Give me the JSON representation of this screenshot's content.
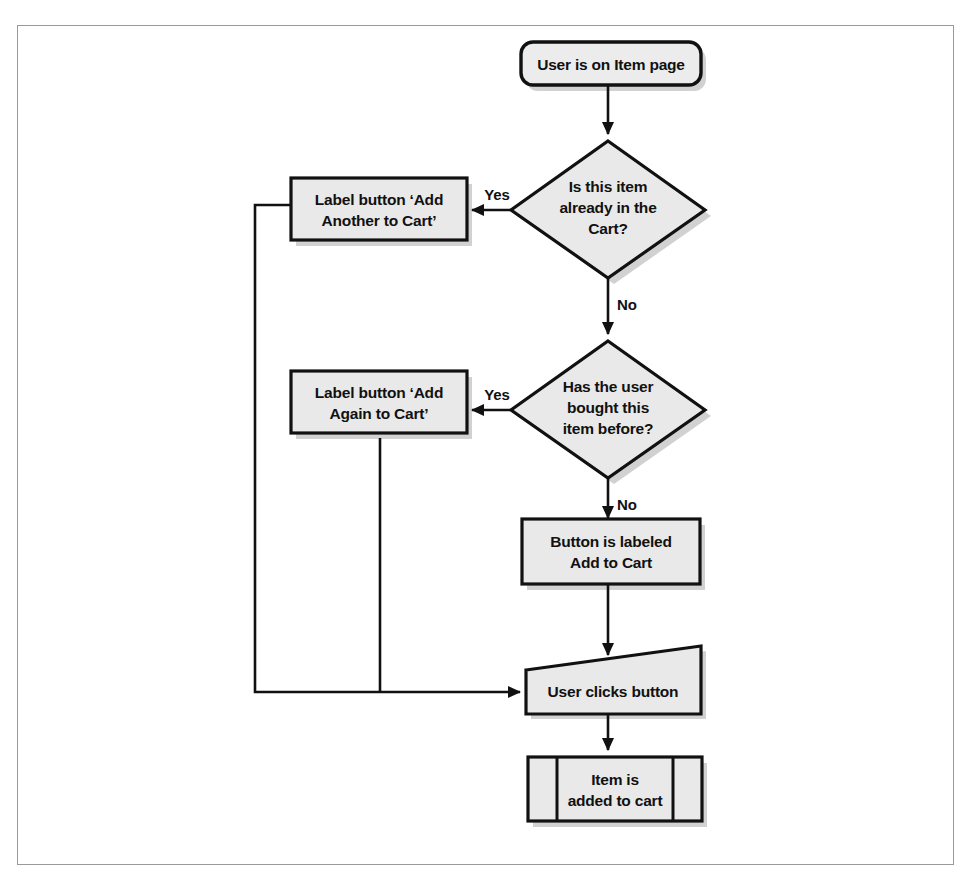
{
  "figure": {
    "type": "flowchart",
    "background_color": "#ffffff",
    "border_color": "#9a9a9a",
    "node_fill_color": "#e9e9e9",
    "node_stroke_color": "#111111"
  },
  "nodes": {
    "start": {
      "shape": "rounded-rectangle",
      "label": "User is on Item page"
    },
    "decision_in_cart": {
      "shape": "diamond",
      "line1": "Is this item",
      "line2": "already in the",
      "line3": "Cart?"
    },
    "label_add_another": {
      "shape": "rectangle",
      "line1": "Label button ‘Add",
      "line2": "Another to Cart’"
    },
    "decision_bought_before": {
      "shape": "diamond",
      "line1": "Has the user",
      "line2": "bought this",
      "line3": "item before?"
    },
    "label_add_again": {
      "shape": "rectangle",
      "line1": "Label button ‘Add",
      "line2": "Again to Cart’"
    },
    "button_labeled_add_to_cart": {
      "shape": "rectangle",
      "line1": "Button is labeled",
      "line2": "Add to Cart"
    },
    "user_clicks_button": {
      "shape": "trapezoid",
      "label": "User clicks button"
    },
    "item_added_to_cart": {
      "shape": "predefined-process",
      "line1": "Item is",
      "line2": "added to cart"
    }
  },
  "edges": {
    "start_to_decision1": {
      "label": ""
    },
    "decision1_yes": {
      "label": "Yes"
    },
    "decision1_no": {
      "label": "No"
    },
    "decision2_yes": {
      "label": "Yes"
    },
    "decision2_no": {
      "label": "No"
    },
    "add_to_cart_to_click": {
      "label": ""
    },
    "add_another_to_click": {
      "label": ""
    },
    "add_again_to_click": {
      "label": ""
    },
    "click_to_added": {
      "label": ""
    }
  }
}
